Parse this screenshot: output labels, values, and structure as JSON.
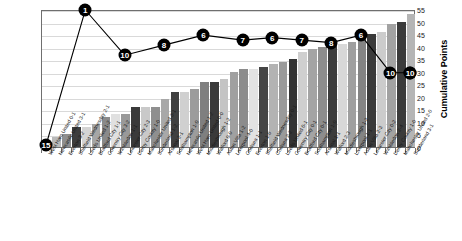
{
  "chart_data": {
    "type": "bar",
    "title": "",
    "xlabel": "",
    "ylabel": "Cumulative Points",
    "ylim": [
      0,
      55
    ],
    "ytick_labels": [
      "0",
      "5",
      "10",
      "15",
      "20",
      "25",
      "30",
      "35",
      "40",
      "45",
      "50",
      "55"
    ],
    "ytick_values": [
      0,
      5,
      10,
      15,
      20,
      25,
      30,
      35,
      40,
      45,
      50,
      55
    ],
    "grid": true,
    "legend": "none",
    "categories": [
      "West Ham United 0-1",
      "Newcastle United 3-1",
      "Everton 3-2",
      "Sheffield Wednesday 2-1",
      "Leeds United 1-2",
      "Bradford City 1-1",
      "Coventry City 3-2",
      "Wimbledon 1-1",
      "Leicester City 2-3",
      "Derby County 1-0",
      "Manchester United 3-1",
      "Sunderland 1-2",
      "Arsenal 2-1",
      "Southampton 1-0",
      "Newcastle United 1-2",
      "West Ham United 0-0",
      "Middlesbrough 1-2",
      "Watford 0-0",
      "Aston Villa 1-2",
      "Liverpool 4-0",
      "Chelsea 1-1",
      "Everton 1-0",
      "Sheffield Wednesday 0-1",
      "Chelsea 2-2",
      "Leeds United 0-1",
      "Coventry City 0-1",
      "Bradford City 0-1",
      "Southampton 1-0",
      "Arsenal 1-1",
      "Watford 2-3",
      "Middlesbrough 1-2",
      "Liverpool 1-1",
      "Aston Villa 2-3",
      "Leicester City 0-2",
      "Wimbledon 2-4",
      "Derby County 1-0",
      "Manchester United 2-0",
      "Sunderland 3-1"
    ],
    "values": [
      1,
      4,
      5,
      8,
      8,
      9,
      12,
      13,
      13,
      16,
      16,
      16,
      19,
      22,
      22,
      23,
      26,
      26,
      27,
      30,
      31,
      31,
      32,
      33,
      34,
      35,
      38,
      39,
      40,
      41,
      41,
      42,
      43,
      45,
      46,
      49,
      50,
      53
    ],
    "bar_colors": [
      "#9e9e9e",
      "#b9b9b9",
      "#8f8f8f",
      "#3d3d3d",
      "#d4d4d4",
      "#a6a6a6",
      "#8a8a8a",
      "#e0e0e0",
      "#999999",
      "#3a3a3a",
      "#c9c9c9",
      "#8f8f8f",
      "#a8a8a8",
      "#404040",
      "#d0d0d0",
      "#9c9c9c",
      "#7f7f7f",
      "#3a3a3a",
      "#c4c4c4",
      "#a0a0a0",
      "#8c8c8c",
      "#e2e2e2",
      "#454545",
      "#b3b3b3",
      "#9a9a9a",
      "#343434",
      "#cfcfcf",
      "#a4a4a4",
      "#8d8d8d",
      "#3c3c3c",
      "#d8d8d8",
      "#9f9f9f",
      "#848484",
      "#3a3a3a",
      "#cccccc",
      "#a2a2a2",
      "#3b3b3b",
      "#b5b5b5"
    ],
    "line_series": {
      "name": "League Position",
      "marker_shape": "circle",
      "marker_fill": "#000000",
      "marker_text_color": "#ffffff",
      "points": [
        {
          "index": 0,
          "label": "15",
          "y_on_points_axis": 1
        },
        {
          "index": 4,
          "label": "1",
          "y_on_points_axis": 55
        },
        {
          "index": 8,
          "label": "10",
          "y_on_points_axis": 37
        },
        {
          "index": 12,
          "label": "8",
          "y_on_points_axis": 41
        },
        {
          "index": 16,
          "label": "6",
          "y_on_points_axis": 45
        },
        {
          "index": 20,
          "label": "7",
          "y_on_points_axis": 43
        },
        {
          "index": 23,
          "label": "6",
          "y_on_points_axis": 44
        },
        {
          "index": 26,
          "label": "7",
          "y_on_points_axis": 43
        },
        {
          "index": 29,
          "label": "8",
          "y_on_points_axis": 42
        },
        {
          "index": 32,
          "label": "6",
          "y_on_points_axis": 45
        },
        {
          "index": 35,
          "label": "10",
          "y_on_points_axis": 30
        },
        {
          "index": 37,
          "label": "10",
          "y_on_points_axis": 30
        },
        {
          "index": 39,
          "label": "10",
          "y_on_points_axis": 30
        }
      ]
    }
  }
}
